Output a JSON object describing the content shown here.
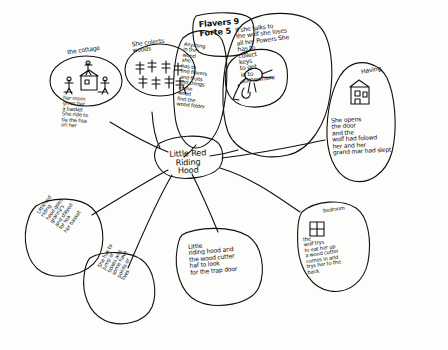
{
  "diagram": {
    "type": "hand-drawn-mind-map",
    "ink_color": "#101010",
    "paper_color": "#fdfdfb"
  },
  "center_node": {
    "label": "Little Red Riding\nHood"
  },
  "nodes": [
    {
      "id": "cottage",
      "caption": "the cottage",
      "icon": "cottage-stick-figures-drawing",
      "text": "her mom\ngives her\na basket\nShe ride to\ntie the hse\non her"
    },
    {
      "id": "woods",
      "caption": "She colects\nwoods",
      "icon": "trees-drawing",
      "text": ""
    },
    {
      "id": "flavers-score",
      "caption": "Flavers 9\nForte 5",
      "text": ""
    },
    {
      "id": "anything-in-the-wood",
      "text": "Anything\nin the\nwood\nshe\nhas to\nfind flavers\nand fruits\nand things\nin the\nwood\nfind the\nwood folder"
    },
    {
      "id": "wolf-talk",
      "text": "If she talks to\nthe wolf she loses\nall her Powers She\nhas to\ncollect\nkeys\nto get\nin to\nsomewhere",
      "icon": "wolf-and-girl-drawing"
    },
    {
      "id": "having-house",
      "caption": "Having",
      "icon": "house-drawing",
      "text": "She opens\nthe door\nand the\nwolf had folowd\nher and her\ngrand mar had slept"
    },
    {
      "id": "bedroom",
      "caption": "bedroom",
      "icon": "window-drawing",
      "text": "the\nwolf trys\nto eat her up\na wood cutter\ncomes in and\ntrys her to the\nback"
    },
    {
      "id": "granny-tea",
      "text": "Little red\nriding\nhood goes\ngranny's\nand stayed\nfor tea\nher basket"
    },
    {
      "id": "jump-boxes",
      "text": "She has to\njump on\nboxes and\nsome have\npoints or\nlives"
    },
    {
      "id": "trap-door",
      "text": "Little\nriding hood and\nthe wood cutter\nhaf to look\nfor the trap door"
    }
  ]
}
